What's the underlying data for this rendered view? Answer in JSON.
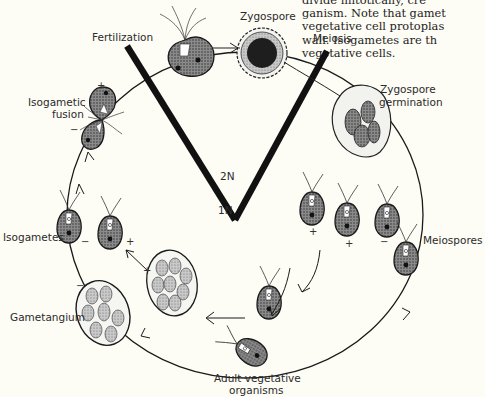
{
  "caption_fragment": {
    "lines": [
      "divide mitotically, cre",
      "ganism. Note that gamet",
      "vegetative cell protoplas",
      "wall. Isogametes are th",
      "vegetative cells."
    ]
  },
  "labels": {
    "zygospore": "Zygospore",
    "fertilization": "Fertilization",
    "meiosis": "Meiosis",
    "zygospore_germination_1": "Zygospore",
    "zygospore_germination_2": "germination",
    "isogametic_fusion_1": "Isogametic",
    "isogametic_fusion_2": "fusion",
    "isogametes": "Isogametes",
    "meiospores": "Meiospores",
    "gametangium": "Gametangium",
    "adult_1": "Adult vegetative",
    "adult_2": "organisms",
    "ploidy_2n": "2N",
    "ploidy_1n": "1N"
  },
  "signs": {
    "plus": "+",
    "minus": "−"
  },
  "colors": {
    "background": "#fdfcf5",
    "ink": "#1a1a1a",
    "cell_fill": "#6b6b6b",
    "cell_dark": "#2a2a2a"
  }
}
